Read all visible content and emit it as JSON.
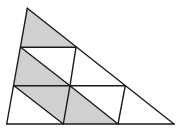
{
  "diagram": {
    "colors": {
      "stroke": "#1a1a1a",
      "shade": "#d0d0d0",
      "background": "#ffffff"
    },
    "points": {
      "apex": [
        27.3,
        8.3
      ],
      "bl": [
        6.7,
        124
      ],
      "br": [
        174,
        124
      ],
      "l1": [
        20.7,
        47.3
      ],
      "r1": [
        76,
        47.3
      ],
      "l2": [
        14,
        85.7
      ],
      "m2": [
        70,
        85.7
      ],
      "r2": [
        125.3,
        85.7
      ],
      "b1": [
        63.3,
        124
      ],
      "b2": [
        118,
        124
      ]
    },
    "shaded": [
      [
        "apex",
        "l1",
        "r1"
      ],
      [
        "l1",
        "l2",
        "m2"
      ],
      [
        "l2",
        "m2",
        "b1"
      ],
      [
        "m2",
        "b1",
        "b2"
      ]
    ],
    "lines": [
      [
        "apex",
        "bl"
      ],
      [
        "apex",
        "br"
      ],
      [
        "bl",
        "br"
      ],
      [
        "l1",
        "r1"
      ],
      [
        "l2",
        "r2"
      ],
      [
        "l1",
        "m2"
      ],
      [
        "m2",
        "b2"
      ],
      [
        "l2",
        "b1"
      ],
      [
        "r1",
        "m2"
      ],
      [
        "m2",
        "b1"
      ],
      [
        "r2",
        "b2"
      ]
    ]
  }
}
